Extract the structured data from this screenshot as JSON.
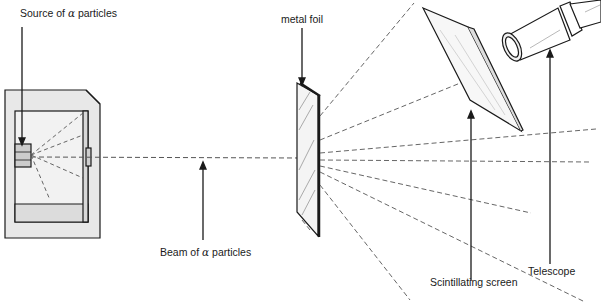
{
  "labels": {
    "source": {
      "prefix": "Source of",
      "symbol": "α",
      "suffix": "particles"
    },
    "metal_foil": "metal foil",
    "beam": {
      "prefix": "Beam of",
      "symbol": "α",
      "suffix": "particles"
    },
    "scintillating_screen": "Scintillating screen",
    "telescope": "Telescope"
  },
  "colors": {
    "line": "#1a1a1a",
    "dash": "#555555",
    "box_fill": "#e6e6e6",
    "background": "#ffffff"
  }
}
